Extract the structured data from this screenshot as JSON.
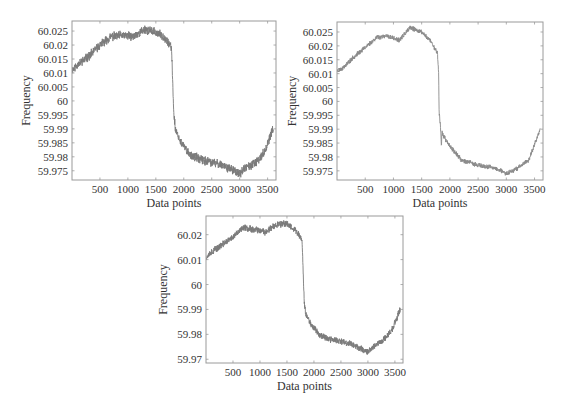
{
  "chart_data": [
    {
      "id": "top-left",
      "type": "line",
      "title": "",
      "xlabel": "Data points",
      "ylabel": "Frequency",
      "xlim": [
        0,
        3650
      ],
      "ylim": [
        59.9717,
        60.0286
      ],
      "xticks": [
        500,
        1000,
        1500,
        2000,
        2500,
        3000,
        3500
      ],
      "yticks": [
        60.025,
        60.02,
        60.015,
        60.01,
        60.005,
        60,
        59.995,
        59.99,
        59.985,
        59.98,
        59.975
      ],
      "ytick_labels": [
        "60.025",
        "60.02",
        "60.015",
        "60.01",
        "60.005",
        "60",
        "59.995",
        "59.99",
        "59.985",
        "59.98",
        "59.975"
      ],
      "grid": false,
      "legend": null,
      "series": [
        {
          "name": "Frequency",
          "color": "#7a7a7a",
          "noise": 0.0013,
          "seed": 11,
          "anchors_x": [
            0,
            100,
            300,
            500,
            700,
            900,
            1100,
            1300,
            1500,
            1650,
            1780,
            1800,
            1820,
            1850,
            1950,
            2100,
            2300,
            2500,
            2700,
            2900,
            3000,
            3100,
            3300,
            3450,
            3600
          ],
          "anchors_y": [
            60.011,
            60.013,
            60.016,
            60.02,
            60.023,
            60.0235,
            60.023,
            60.0255,
            60.0245,
            60.023,
            60.019,
            60.008,
            59.996,
            59.99,
            59.985,
            59.981,
            59.979,
            59.978,
            59.977,
            59.975,
            59.974,
            59.976,
            59.978,
            59.982,
            59.99
          ]
        }
      ]
    },
    {
      "id": "top-right",
      "type": "line",
      "title": "",
      "xlabel": "Data points",
      "ylabel": "Frequency",
      "xlim": [
        0,
        3650
      ],
      "ylim": [
        59.9717,
        60.0286
      ],
      "xticks": [
        500,
        1000,
        1500,
        2000,
        2500,
        3000,
        3500
      ],
      "yticks": [
        60.025,
        60.02,
        60.015,
        60.01,
        60.005,
        60,
        59.995,
        59.99,
        59.985,
        59.98,
        59.975
      ],
      "ytick_labels": [
        "60.025",
        "60.02",
        "60.015",
        "60.01",
        "60.005",
        "60",
        "59.995",
        "59.99",
        "59.985",
        "59.98",
        "59.975"
      ],
      "grid": false,
      "legend": null,
      "series": [
        {
          "name": "Frequency",
          "color": "#8a8a8a",
          "noise": 0.0007,
          "seed": 23,
          "anchors_x": [
            0,
            100,
            300,
            500,
            700,
            900,
            1100,
            1300,
            1500,
            1650,
            1780,
            1800,
            1810,
            1830,
            1850,
            1860,
            1900,
            2000,
            2200,
            2500,
            2800,
            3000,
            3200,
            3400,
            3600
          ],
          "anchors_y": [
            60.011,
            60.012,
            60.016,
            60.0195,
            60.023,
            60.0235,
            60.022,
            60.0265,
            60.025,
            60.022,
            60.0175,
            60.01,
            59.996,
            59.992,
            59.984,
            59.989,
            59.987,
            59.984,
            59.979,
            59.977,
            59.976,
            59.974,
            59.976,
            59.979,
            59.99
          ]
        }
      ]
    },
    {
      "id": "bottom",
      "type": "line",
      "title": "",
      "xlabel": "Data points",
      "ylabel": "Frequency",
      "xlim": [
        0,
        3650
      ],
      "ylim": [
        59.9685,
        60.0275
      ],
      "xticks": [
        500,
        1000,
        1500,
        2000,
        2500,
        3000,
        3500
      ],
      "yticks": [
        60.02,
        60.01,
        60,
        59.99,
        59.98,
        59.97
      ],
      "ytick_labels": [
        "60.02",
        "60.01",
        "60",
        "59.99",
        "59.98",
        "59.97"
      ],
      "grid": false,
      "legend": null,
      "series": [
        {
          "name": "Frequency",
          "color": "#7a7a7a",
          "noise": 0.0011,
          "seed": 37,
          "anchors_x": [
            0,
            100,
            300,
            500,
            700,
            900,
            1100,
            1300,
            1500,
            1650,
            1780,
            1800,
            1820,
            1850,
            1950,
            2100,
            2300,
            2500,
            2700,
            2900,
            3000,
            3100,
            3300,
            3450,
            3600
          ],
          "anchors_y": [
            60.011,
            60.013,
            60.016,
            60.019,
            60.023,
            60.022,
            60.021,
            60.024,
            60.0245,
            60.022,
            60.018,
            60.005,
            59.993,
            59.988,
            59.984,
            59.98,
            59.978,
            59.977,
            59.976,
            59.974,
            59.973,
            59.975,
            59.978,
            59.982,
            59.99
          ]
        }
      ]
    }
  ],
  "layout_boxes": [
    {
      "left": 72,
      "top": 21,
      "width": 204,
      "height": 159,
      "ylabel_x": 30,
      "ytick_x": 68,
      "xtick_y": 193,
      "xlabel_y": 207
    },
    {
      "left": 337,
      "top": 22,
      "width": 206,
      "height": 158,
      "ylabel_x": 296,
      "ytick_x": 333,
      "xtick_y": 193,
      "xlabel_y": 207
    },
    {
      "left": 206,
      "top": 216,
      "width": 197,
      "height": 147,
      "ylabel_x": 167,
      "ytick_x": 202,
      "xtick_y": 376,
      "xlabel_y": 390
    }
  ]
}
